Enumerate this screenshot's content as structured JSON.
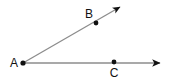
{
  "figure": {
    "background_color": "#ffffff",
    "line_color": "#8c8c8c",
    "arrow_color": "#111111",
    "point_color": "#111111",
    "label_color": "#111111",
    "width": 178,
    "height": 79
  },
  "points": [
    {
      "id": "A",
      "label": "A",
      "role": "vertex",
      "x": 23,
      "y": 63,
      "label_x": 14,
      "label_y": 67
    },
    {
      "id": "B",
      "label": "B",
      "role": "ray-point",
      "x": 96,
      "y": 23,
      "label_x": 89,
      "label_y": 18
    },
    {
      "id": "C",
      "label": "C",
      "role": "ray-point",
      "x": 114,
      "y": 63,
      "label_x": 114,
      "label_y": 77
    }
  ],
  "rays": [
    {
      "id": "ray-AB",
      "name": "ray-ab",
      "from": "A",
      "through": "B",
      "start_x": 23,
      "start_y": 63,
      "end_x": 123,
      "end_y": 5,
      "arrow": "end"
    },
    {
      "id": "ray-AC",
      "name": "ray-ac",
      "from": "A",
      "through": "C",
      "start_x": 23,
      "start_y": 63,
      "end_x": 165,
      "end_y": 63,
      "arrow": "end"
    }
  ],
  "labels": {
    "a": "A",
    "b": "B",
    "c": "C"
  }
}
